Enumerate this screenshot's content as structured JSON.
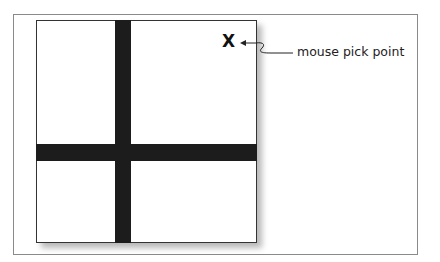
{
  "diagram": {
    "marker": {
      "glyph": "X",
      "meaning": "pick point marker"
    },
    "callout_label": "mouse pick point",
    "elements": [
      "outer frame",
      "white square with drop shadow",
      "vertical dark bar",
      "horizontal dark bar"
    ]
  }
}
